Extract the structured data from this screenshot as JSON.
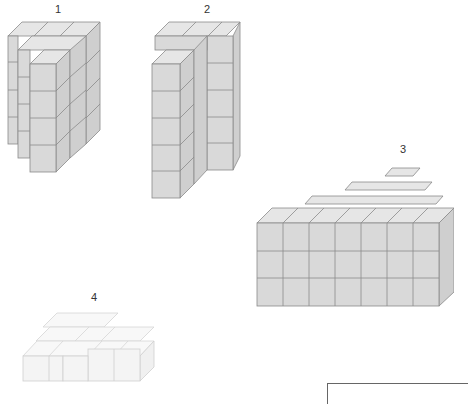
{
  "figures": [
    {
      "id": "1",
      "label": "1",
      "description": "three stacked columns of cubes, stepped back"
    },
    {
      "id": "2",
      "label": "2",
      "description": "L-shaped tower of cubes, 5 high front column"
    },
    {
      "id": "3",
      "label": "3",
      "description": "7 wide by 3 high block with stepped top layers"
    },
    {
      "id": "4",
      "label": "4",
      "description": "flat single-layer arrangement of light cubes"
    }
  ],
  "colors": {
    "cube_front": "#d9d9d9",
    "cube_top": "#e6e6e6",
    "cube_side": "#cfcfcf",
    "edge": "#8a8a8a",
    "light_cube": "#f4f4f4"
  }
}
